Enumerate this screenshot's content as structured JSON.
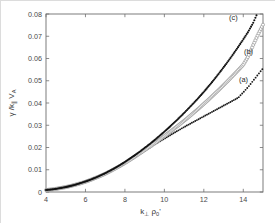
{
  "chart_data": {
    "type": "scatter",
    "title": "",
    "xlabel": "k⊥ ρ₀'",
    "ylabel": "γ / k∥ V_A",
    "xlim": [
      4,
      15
    ],
    "ylim": [
      0,
      0.08
    ],
    "xticks": [
      4,
      6,
      8,
      10,
      12,
      14
    ],
    "yticks": [
      0,
      0.01,
      0.02,
      0.03,
      0.04,
      0.05,
      0.06,
      0.07,
      0.08
    ],
    "xtick_labels": [
      "4",
      "6",
      "8",
      "10",
      "12",
      "14"
    ],
    "ytick_labels": [
      "0",
      "0.01",
      "0.02",
      "0.03",
      "0.04",
      "0.05",
      "0.06",
      "0.07",
      "0.08"
    ],
    "grid": false,
    "legend_position": "inline-annotations",
    "marker_colors": {
      "a": "#1a1a1a",
      "b": "#9a9a9a",
      "c": "#111111"
    },
    "series": [
      {
        "name": "(a)",
        "label": "(a)",
        "marker": "dotted-small",
        "filled": true,
        "color": "#1a1a1a",
        "annotation": "(a)",
        "x": [
          4.0,
          4.25,
          4.5,
          4.75,
          5.0,
          5.25,
          5.5,
          5.75,
          6.0,
          6.25,
          6.5,
          6.75,
          7.0,
          7.25,
          7.5,
          7.75,
          8.0,
          8.25,
          8.5,
          8.75,
          9.0,
          9.25,
          9.5,
          9.75,
          10.0,
          10.25,
          10.5,
          10.75,
          11.0,
          11.25,
          11.5,
          11.75,
          12.0,
          12.25,
          12.5,
          12.75,
          13.0,
          13.25,
          13.5,
          13.75,
          14.0,
          14.25,
          14.5,
          14.75,
          15.0
        ],
        "y": [
          0.0009,
          0.0011,
          0.0014,
          0.0018,
          0.0022,
          0.0027,
          0.0033,
          0.0039,
          0.0046,
          0.0054,
          0.0063,
          0.0072,
          0.0082,
          0.0093,
          0.0105,
          0.0117,
          0.013,
          0.0143,
          0.0157,
          0.0171,
          0.0185,
          0.0199,
          0.0213,
          0.0226,
          0.024,
          0.0253,
          0.0266,
          0.0279,
          0.0292,
          0.0304,
          0.0316,
          0.0328,
          0.034,
          0.0352,
          0.0364,
          0.0376,
          0.0388,
          0.04,
          0.0412,
          0.0424,
          0.0448,
          0.0472,
          0.05,
          0.0528,
          0.0556
        ]
      },
      {
        "name": "(b)",
        "label": "(b)",
        "marker": "open-circle",
        "filled": false,
        "color": "#9a9a9a",
        "annotation": "(b)",
        "x": [
          4.0,
          4.25,
          4.5,
          4.75,
          5.0,
          5.25,
          5.5,
          5.75,
          6.0,
          6.25,
          6.5,
          6.75,
          7.0,
          7.25,
          7.5,
          7.75,
          8.0,
          8.25,
          8.5,
          8.75,
          9.0,
          9.25,
          9.5,
          9.75,
          10.0,
          10.25,
          10.5,
          10.75,
          11.0,
          11.25,
          11.5,
          11.75,
          12.0,
          12.25,
          12.5,
          12.75,
          13.0,
          13.25,
          13.5,
          13.75,
          14.0,
          14.25,
          14.5,
          14.75,
          15.0
        ],
        "y": [
          0.0009,
          0.0011,
          0.0014,
          0.0018,
          0.0022,
          0.0027,
          0.0033,
          0.0039,
          0.0046,
          0.0054,
          0.0063,
          0.0072,
          0.0082,
          0.0093,
          0.0105,
          0.0117,
          0.013,
          0.0144,
          0.0158,
          0.0173,
          0.0188,
          0.0203,
          0.0219,
          0.0235,
          0.0251,
          0.0268,
          0.0285,
          0.0302,
          0.032,
          0.0338,
          0.0357,
          0.0376,
          0.0396,
          0.0416,
          0.0437,
          0.0458,
          0.048,
          0.0502,
          0.0525,
          0.0548,
          0.0572,
          0.0609,
          0.066,
          0.0708,
          0.0752
        ]
      },
      {
        "name": "(c)",
        "label": "(c)",
        "marker": "filled-dot",
        "filled": true,
        "color": "#111111",
        "annotation": "(c)",
        "x": [
          4.0,
          4.25,
          4.5,
          4.75,
          5.0,
          5.25,
          5.5,
          5.75,
          6.0,
          6.25,
          6.5,
          6.75,
          7.0,
          7.25,
          7.5,
          7.75,
          8.0,
          8.25,
          8.5,
          8.75,
          9.0,
          9.25,
          9.5,
          9.75,
          10.0,
          10.25,
          10.5,
          10.75,
          11.0,
          11.25,
          11.5,
          11.75,
          12.0,
          12.25,
          12.5,
          12.75,
          13.0,
          13.25,
          13.5,
          13.75,
          14.0,
          14.25,
          14.5,
          14.7
        ],
        "y": [
          0.0009,
          0.0011,
          0.0014,
          0.0018,
          0.0022,
          0.0027,
          0.0033,
          0.004,
          0.0047,
          0.0055,
          0.0064,
          0.0074,
          0.0084,
          0.0096,
          0.0108,
          0.0121,
          0.0135,
          0.015,
          0.0165,
          0.0181,
          0.0198,
          0.0215,
          0.0233,
          0.0252,
          0.0271,
          0.0291,
          0.0312,
          0.0333,
          0.0355,
          0.0378,
          0.0401,
          0.0425,
          0.045,
          0.0476,
          0.0503,
          0.0531,
          0.056,
          0.059,
          0.0621,
          0.0653,
          0.0686,
          0.072,
          0.076,
          0.08
        ]
      }
    ]
  }
}
